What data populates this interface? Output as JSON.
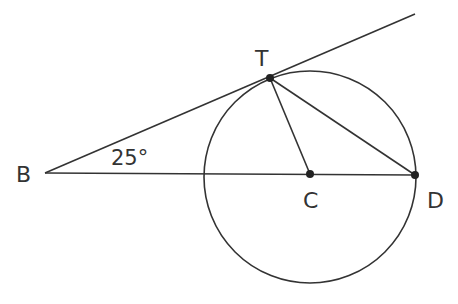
{
  "diagram": {
    "type": "geometry",
    "stroke_color": "#333333",
    "labels": {
      "B": "B",
      "T": "T",
      "C": "C",
      "D": "D",
      "angle": "25°"
    },
    "points": {
      "B": [
        45,
        173
      ],
      "T": [
        270,
        78
      ],
      "C": [
        310,
        174
      ],
      "D": [
        415,
        175
      ],
      "tangent_end": [
        415,
        14
      ]
    },
    "circle": {
      "center": [
        310,
        177
      ],
      "radius": 106
    },
    "segments": [
      [
        "B",
        "D"
      ],
      [
        "B",
        "tangent_end"
      ],
      [
        "T",
        "C"
      ],
      [
        "T",
        "D"
      ]
    ],
    "angle_B_degrees": 25
  }
}
